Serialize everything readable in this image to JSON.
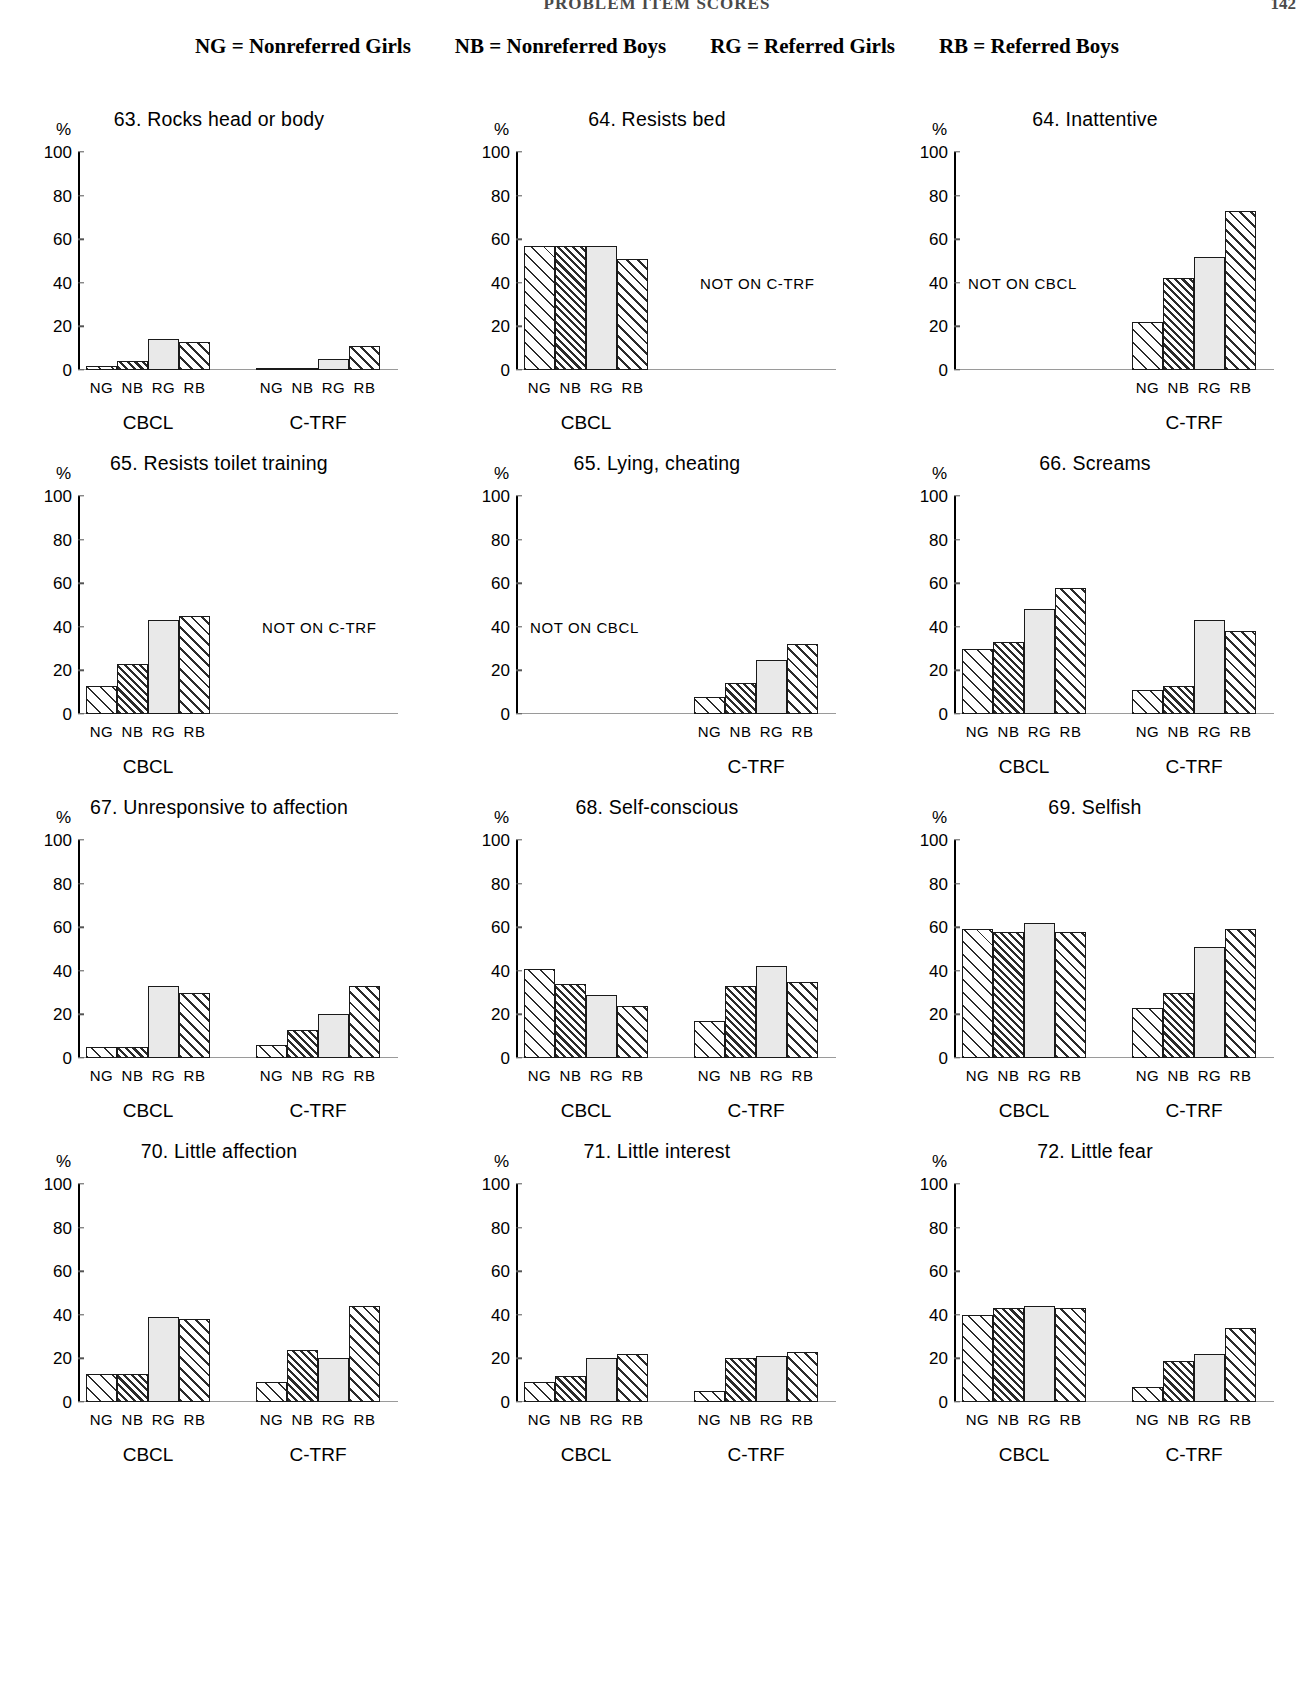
{
  "page": {
    "running_title": "PROBLEM ITEM SCORES",
    "page_number": "142"
  },
  "legend": [
    {
      "code": "NG",
      "label": "NG  =  Nonreferred Girls"
    },
    {
      "code": "NB",
      "label": "NB  =  Nonreferred Boys"
    },
    {
      "code": "RG",
      "label": "RG  =  Referred Girls"
    },
    {
      "code": "RB",
      "label": "RB  =  Referred Boys"
    }
  ],
  "axis": {
    "y_unit": "%",
    "yticks": [
      "100",
      "80",
      "60",
      "40",
      "20",
      "0"
    ],
    "ylim": [
      0,
      100
    ],
    "group_labels": [
      "NG",
      "NB",
      "RG",
      "RB"
    ],
    "panel_cbcl": "CBCL",
    "panel_ctrf": "C-TRF",
    "na_ctrf": "NOT ON C-TRF",
    "na_cbcl": "NOT ON CBCL"
  },
  "chart_data": [
    {
      "id": "item-63",
      "type": "bar",
      "title": "63. Rocks head or body",
      "ylabel": "%",
      "xlabel": "",
      "ylim": [
        0,
        100
      ],
      "categories": [
        "NG",
        "NB",
        "RG",
        "RB"
      ],
      "series": [
        {
          "name": "CBCL",
          "values": [
            2,
            4,
            14,
            13
          ],
          "available": true
        },
        {
          "name": "C-TRF",
          "values": [
            1,
            1,
            5,
            11
          ],
          "available": true
        }
      ]
    },
    {
      "id": "item-64-bed",
      "type": "bar",
      "title": "64. Resists bed",
      "ylabel": "%",
      "xlabel": "",
      "ylim": [
        0,
        100
      ],
      "categories": [
        "NG",
        "NB",
        "RG",
        "RB"
      ],
      "series": [
        {
          "name": "CBCL",
          "values": [
            57,
            57,
            57,
            51
          ],
          "available": true
        },
        {
          "name": "C-TRF",
          "values": [],
          "available": false,
          "note": "NOT ON C-TRF"
        }
      ]
    },
    {
      "id": "item-64-inattentive",
      "type": "bar",
      "title": "64. Inattentive",
      "ylabel": "%",
      "xlabel": "",
      "ylim": [
        0,
        100
      ],
      "categories": [
        "NG",
        "NB",
        "RG",
        "RB"
      ],
      "series": [
        {
          "name": "CBCL",
          "values": [],
          "available": false,
          "note": "NOT ON CBCL"
        },
        {
          "name": "C-TRF",
          "values": [
            22,
            42,
            52,
            73
          ],
          "available": true
        }
      ]
    },
    {
      "id": "item-65-toilet",
      "type": "bar",
      "title": "65. Resists toilet training",
      "ylabel": "%",
      "xlabel": "",
      "ylim": [
        0,
        100
      ],
      "categories": [
        "NG",
        "NB",
        "RG",
        "RB"
      ],
      "series": [
        {
          "name": "CBCL",
          "values": [
            13,
            23,
            43,
            45
          ],
          "available": true
        },
        {
          "name": "C-TRF",
          "values": [],
          "available": false,
          "note": "NOT ON C-TRF"
        }
      ]
    },
    {
      "id": "item-65-lying",
      "type": "bar",
      "title": "65. Lying, cheating",
      "ylabel": "%",
      "xlabel": "",
      "ylim": [
        0,
        100
      ],
      "categories": [
        "NG",
        "NB",
        "RG",
        "RB"
      ],
      "series": [
        {
          "name": "CBCL",
          "values": [],
          "available": false,
          "note": "NOT ON CBCL"
        },
        {
          "name": "C-TRF",
          "values": [
            8,
            14,
            25,
            32
          ],
          "available": true
        }
      ]
    },
    {
      "id": "item-66-screams",
      "type": "bar",
      "title": "66. Screams",
      "ylabel": "%",
      "xlabel": "",
      "ylim": [
        0,
        100
      ],
      "categories": [
        "NG",
        "NB",
        "RG",
        "RB"
      ],
      "series": [
        {
          "name": "CBCL",
          "values": [
            30,
            33,
            48,
            58
          ],
          "available": true
        },
        {
          "name": "C-TRF",
          "values": [
            11,
            13,
            43,
            38
          ],
          "available": true
        }
      ]
    },
    {
      "id": "item-67",
      "type": "bar",
      "title": "67. Unresponsive to affection",
      "ylabel": "%",
      "xlabel": "",
      "ylim": [
        0,
        100
      ],
      "categories": [
        "NG",
        "NB",
        "RG",
        "RB"
      ],
      "series": [
        {
          "name": "CBCL",
          "values": [
            5,
            5,
            33,
            30
          ],
          "available": true
        },
        {
          "name": "C-TRF",
          "values": [
            6,
            13,
            20,
            33
          ],
          "available": true
        }
      ]
    },
    {
      "id": "item-68",
      "type": "bar",
      "title": "68. Self-conscious",
      "ylabel": "%",
      "xlabel": "",
      "ylim": [
        0,
        100
      ],
      "categories": [
        "NG",
        "NB",
        "RG",
        "RB"
      ],
      "series": [
        {
          "name": "CBCL",
          "values": [
            41,
            34,
            29,
            24
          ],
          "available": true
        },
        {
          "name": "C-TRF",
          "values": [
            17,
            33,
            42,
            35
          ],
          "available": true
        }
      ]
    },
    {
      "id": "item-69",
      "type": "bar",
      "title": "69. Selfish",
      "ylabel": "%",
      "xlabel": "",
      "ylim": [
        0,
        100
      ],
      "categories": [
        "NG",
        "NB",
        "RG",
        "RB"
      ],
      "series": [
        {
          "name": "CBCL",
          "values": [
            59,
            58,
            62,
            58
          ],
          "available": true
        },
        {
          "name": "C-TRF",
          "values": [
            23,
            30,
            51,
            59
          ],
          "available": true
        }
      ]
    },
    {
      "id": "item-70",
      "type": "bar",
      "title": "70. Little affection",
      "ylabel": "%",
      "xlabel": "",
      "ylim": [
        0,
        100
      ],
      "categories": [
        "NG",
        "NB",
        "RG",
        "RB"
      ],
      "series": [
        {
          "name": "CBCL",
          "values": [
            13,
            13,
            39,
            38
          ],
          "available": true
        },
        {
          "name": "C-TRF",
          "values": [
            9,
            24,
            20,
            44
          ],
          "available": true
        }
      ]
    },
    {
      "id": "item-71",
      "type": "bar",
      "title": "71. Little interest",
      "ylabel": "%",
      "xlabel": "",
      "ylim": [
        0,
        100
      ],
      "categories": [
        "NG",
        "NB",
        "RG",
        "RB"
      ],
      "series": [
        {
          "name": "CBCL",
          "values": [
            9,
            12,
            20,
            22
          ],
          "available": true
        },
        {
          "name": "C-TRF",
          "values": [
            5,
            20,
            21,
            23
          ],
          "available": true
        }
      ]
    },
    {
      "id": "item-72",
      "type": "bar",
      "title": "72. Little fear",
      "ylabel": "%",
      "xlabel": "",
      "ylim": [
        0,
        100
      ],
      "categories": [
        "NG",
        "NB",
        "RG",
        "RB"
      ],
      "series": [
        {
          "name": "CBCL",
          "values": [
            40,
            43,
            44,
            43
          ],
          "available": true
        },
        {
          "name": "C-TRF",
          "values": [
            7,
            19,
            22,
            34
          ],
          "available": true
        }
      ]
    }
  ]
}
